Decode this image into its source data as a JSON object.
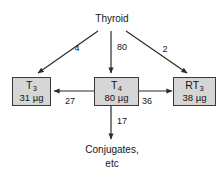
{
  "diagram": {
    "source": {
      "label": "Thyroid"
    },
    "nodes": [
      {
        "id": "t3",
        "name": "T",
        "subscript": "3",
        "amount": "31 µg"
      },
      {
        "id": "t4",
        "name": "T",
        "subscript": "4",
        "amount": "80 µg"
      },
      {
        "id": "rt3",
        "name": "RT",
        "subscript": "3",
        "amount": "38 µg"
      }
    ],
    "sink": {
      "line1": "Conjugates,",
      "line2": "etc"
    },
    "edges": [
      {
        "id": "thyroid-to-t3",
        "from": "Thyroid",
        "to": "T3",
        "value": "4"
      },
      {
        "id": "thyroid-to-t4",
        "from": "Thyroid",
        "to": "T4",
        "value": "80"
      },
      {
        "id": "thyroid-to-rt3",
        "from": "Thyroid",
        "to": "RT3",
        "value": "2"
      },
      {
        "id": "t4-to-t3",
        "from": "T4",
        "to": "T3",
        "value": "27"
      },
      {
        "id": "t4-to-rt3",
        "from": "T4",
        "to": "RT3",
        "value": "36"
      },
      {
        "id": "t4-to-sink",
        "from": "T4",
        "to": "Conjugates",
        "value": "17"
      }
    ],
    "colors": {
      "background": "#ffffff",
      "box_fill": "#d6d6d6",
      "box_border": "#3a3a3a",
      "text": "#141414",
      "arrow": "#2b2b2b"
    }
  }
}
